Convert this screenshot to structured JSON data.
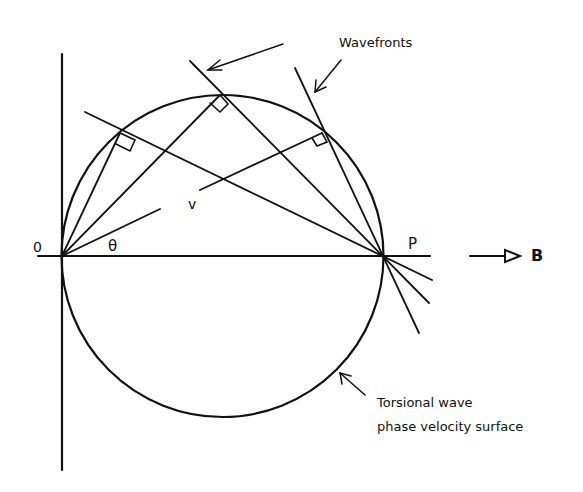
{
  "diagram": {
    "labels": {
      "origin": "0",
      "point_p": "P",
      "angle": "θ",
      "velocity": "v",
      "field": "B",
      "wavefronts": "Wavefronts",
      "surface_line1": "Torsional wave",
      "surface_line2": "phase velocity surface"
    },
    "geometry": {
      "origin_px": [
        62,
        256
      ],
      "p_px": [
        383,
        256
      ],
      "circle_center_px": [
        222.5,
        256
      ],
      "circle_radius_px": 161,
      "tangent_points_px": [
        [
          120,
          133
        ],
        [
          220,
          95
        ],
        [
          322,
          133
        ]
      ]
    },
    "colors": {
      "ink": "#111111",
      "background": "#ffffff"
    }
  }
}
